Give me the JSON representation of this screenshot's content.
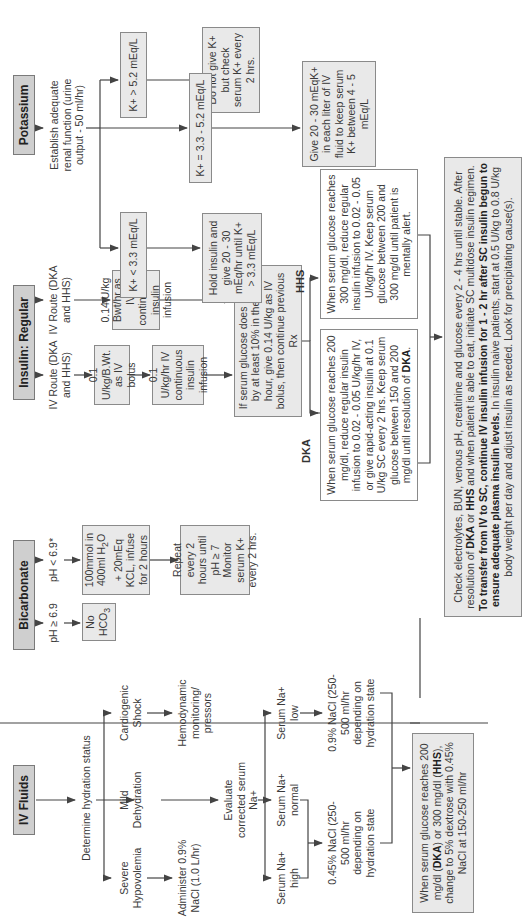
{
  "orientation": "rotated-90-ccw",
  "sections": {
    "iv_fluids": {
      "header": "IV Fluids",
      "step1": "Determine hydration status",
      "branches": {
        "severe": "Severe Hypovolemia",
        "mild": "Mild Dehydration",
        "cardiogenic": "Cardiogenic Shock"
      },
      "severe_action": "Administer 0.9% NaCl (1.0 L/hr)",
      "cardiogenic_action": "Hemodynamic monitoring/ pressors",
      "evaluate": "Evaluate corrected serum Na+",
      "sodium": {
        "high": "Serum Na+ high",
        "normal": "Serum Na+ normal",
        "low": "Serum Na+ low"
      },
      "half_saline": "0.45% NaCl (250-500 ml/hr depending on hydration state",
      "normal_saline": "0.9% NaCl (250-500 ml/hr depending on hydration state",
      "dextrose_box_parts": [
        "When serum glucose reaches 200 mg/dl (",
        "DKA",
        ") or 300 mg/dl (",
        "HHS",
        "), change to 5% dextrose with 0.45% NaCl at 150-250 ml/hr"
      ]
    },
    "bicarbonate": {
      "header": "Bicarbonate",
      "ph_high": "pH ≥ 6.9",
      "ph_low": "pH < 6.9*",
      "no_hco3": "No HCO",
      "no_hco3_sub": "3",
      "infuse_parts": [
        "100mmol in 400ml H",
        "2",
        "O + 20mEq KCL, infuse for 2 hours"
      ],
      "repeat": "Repeat every 2 hours until pH ≥ 7 Monitor serum K+ every 2 hrs."
    },
    "insulin": {
      "header": "Insulin: Regular",
      "route1": "IV Route (DKA and HHS)",
      "route2": "IV Route (DKA and HHS)",
      "bolus": "0.1 U/kg/B.Wt. as IV bolus",
      "infusion": "0.1 U/kg/hr IV continuous insulin infusion",
      "alt_infusion": "0.14 U/kg Bwt/hr as IV continuous insulin infusion",
      "no_fall": "If serum glucose does not fall by at least 10% in the first hour, give 0.14 U/kg as IV bolus, then continue previous Rx",
      "dka_label": "DKA",
      "hhs_label": "HHS",
      "dka_parts": [
        "When serum glucose reaches 200 mg/dl, reduce regular insulin infusion to 0.02 - 0.05 U/kg/hr IV, or give rapid-acting insulin at 0.1 U/kg SC every 2 hrs. Keep serum glucose between 150 and 200 mg/dl until resolution of ",
        "DKA",
        "."
      ],
      "hhs": "When serum glucose reaches 300 mg/dl, reduce regular insulin infusion to 0.02 - 0.05 U/kg/hr IV. Keep serum glucose between 200 and 300 mg/dl until patient is mentally alert."
    },
    "potassium": {
      "header": "Potassium",
      "renal": "Establish adequate renal function (urine output - 50 ml/hr)",
      "k_low": "K+ < 3.3 mEq/L",
      "k_high": "K+ > 5.2 mEq/L",
      "k_mid": "K+ = 3.3 - 5.2 mEq/L",
      "hold": "Hold insulin and give 20 - 30 mEq/hr until K+ > 3.3 mEq/L",
      "do_not": "Do not give K+ but check serum K+ every 2 hrs.",
      "give": "Give 20 - 30 mEqK+ in each liter of IV fluid to keep serum K+ between 4 - 5 mEq/L"
    },
    "final": {
      "parts": [
        "Check electrolytes, BUN, venous pH, creatinine and glucose every 2 - 4 hrs until stable. After resolution of ",
        "DKA",
        " or ",
        "HHS",
        " and when patient is able to eat, initiate SC multidose insulin regimen. ",
        "To transfer from IV to SC, continue IV insulin infusion for 1 - 2 hr after SC insulin begun to ensure adequate plasma insulin levels.",
        " In insulin naive patients, start at 0.5 U/kg to 0.8 U/kg body weight per day and adjust insulin as needed. Look for precipitating cause(s)."
      ]
    }
  },
  "colors": {
    "header_fill": "#cfcfcf",
    "box_fill": "#e9e9e9",
    "line": "#444444"
  }
}
